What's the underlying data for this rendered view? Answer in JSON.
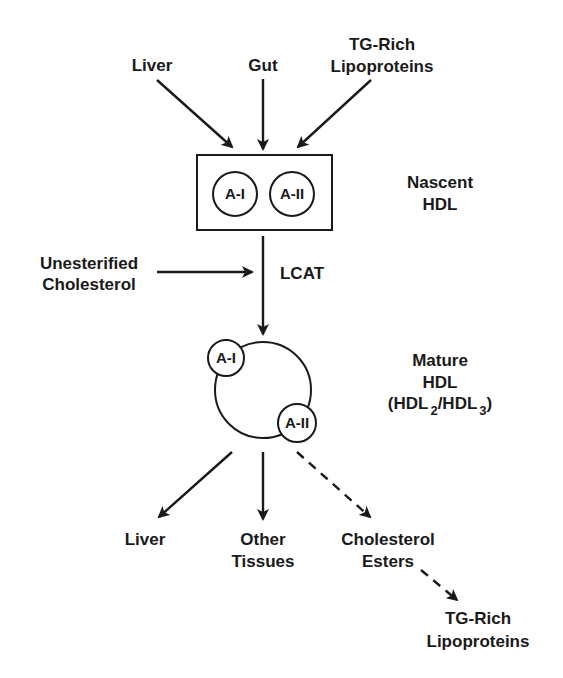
{
  "diagram": {
    "sources": {
      "liver": "Liver",
      "gut": "Gut",
      "tg_rich_top": [
        "TG-Rich",
        "Lipoproteins"
      ]
    },
    "nascent": {
      "label": [
        "Nascent",
        "HDL"
      ],
      "apo_a1": "A-I",
      "apo_a2": "A-II"
    },
    "input": {
      "unesterified": [
        "Unesterified",
        "Cholesterol"
      ],
      "enzyme": "LCAT"
    },
    "mature": {
      "label": [
        "Mature",
        "HDL"
      ],
      "subclass_prefix": "(HDL",
      "sub2": "2",
      "slash": "/HDL",
      "sub3": "3",
      "close": ")",
      "apo_a1": "A-I",
      "apo_a2": "A-II"
    },
    "destinations": {
      "liver": "Liver",
      "other_tissues": [
        "Other",
        "Tissues"
      ],
      "cholesterol_esters": [
        "Cholesterol",
        "Esters"
      ],
      "tg_rich_bottom": [
        "TG-Rich",
        "Lipoproteins"
      ]
    },
    "colors": {
      "stroke": "#1a1a1a",
      "background": "#ffffff"
    }
  }
}
